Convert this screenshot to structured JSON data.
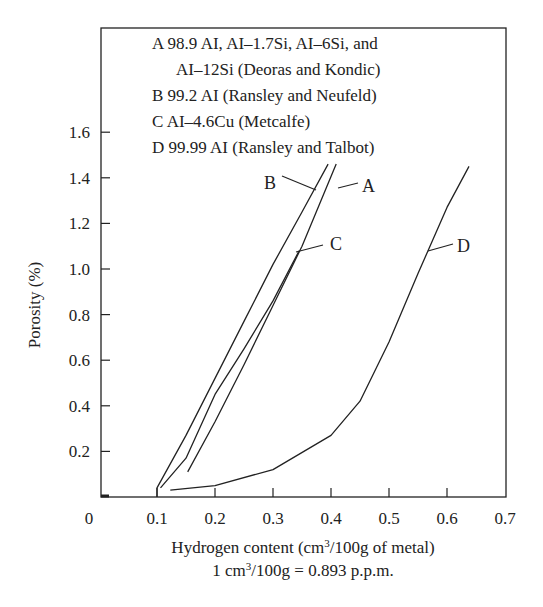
{
  "chart_data": {
    "type": "line",
    "title": "",
    "xlabel": "Hydrogen content (cm3/100g of metal)",
    "xlabel_parts": {
      "pre": "Hydrogen content (cm",
      "sup": "3",
      "post": "/100g of metal)"
    },
    "xlabel_note": "1 cm3/100g = 0.893 p.p.m.",
    "xlabel_note_parts": {
      "pre": "1 cm",
      "sup": "3",
      "post": "/100g = 0.893 p.p.m."
    },
    "ylabel": "Porosity (%)",
    "xlim": [
      0,
      0.7
    ],
    "ylim": [
      0,
      1.6
    ],
    "x_ticks": [
      "0",
      "0.1",
      "0.2",
      "0.3",
      "0.4",
      "0.5",
      "0.6",
      "0.7"
    ],
    "y_ticks": [
      "0.2",
      "0.4",
      "0.6",
      "0.8",
      "1.0",
      "1.2",
      "1.4",
      "1.6"
    ],
    "grid": false,
    "legend_position": "top inside",
    "legend": [
      {
        "key": "A",
        "line1": "A 98.9 AI, AI–1.7Si, AI–6Si, and",
        "line2": "AI–12Si (Deoras and Kondic)"
      },
      {
        "key": "B",
        "line1": "B 99.2 AI (Ransley and Neufeld)"
      },
      {
        "key": "C",
        "line1": "C AI–4.6Cu (Metcalfe)"
      },
      {
        "key": "D",
        "line1": "D 99.99 AI (Ransley and Talbot)"
      }
    ],
    "series": [
      {
        "name": "A",
        "x": [
          0.153,
          0.2,
          0.25,
          0.3,
          0.35,
          0.409
        ],
        "y": [
          0.11,
          0.33,
          0.58,
          0.84,
          1.1,
          1.46
        ]
      },
      {
        "name": "B",
        "x": [
          0.1,
          0.1,
          0.15,
          0.2,
          0.25,
          0.3,
          0.35,
          0.395
        ],
        "y": [
          0.0,
          0.04,
          0.27,
          0.52,
          0.77,
          1.02,
          1.25,
          1.46
        ]
      },
      {
        "name": "C",
        "x": [
          0.106,
          0.15,
          0.2,
          0.25,
          0.3,
          0.345
        ],
        "y": [
          0.04,
          0.17,
          0.45,
          0.65,
          0.86,
          1.08
        ]
      },
      {
        "name": "D",
        "x": [
          0.123,
          0.2,
          0.3,
          0.4,
          0.45,
          0.5,
          0.55,
          0.6,
          0.638
        ],
        "y": [
          0.03,
          0.05,
          0.12,
          0.27,
          0.42,
          0.68,
          0.98,
          1.27,
          1.45
        ]
      }
    ],
    "annotations": [
      {
        "label": "A",
        "x": 0.455,
        "y": 1.37
      },
      {
        "label": "B",
        "x": 0.31,
        "y": 1.38
      },
      {
        "label": "C",
        "x": 0.41,
        "y": 1.12
      },
      {
        "label": "D",
        "x": 0.625,
        "y": 1.11
      }
    ]
  }
}
